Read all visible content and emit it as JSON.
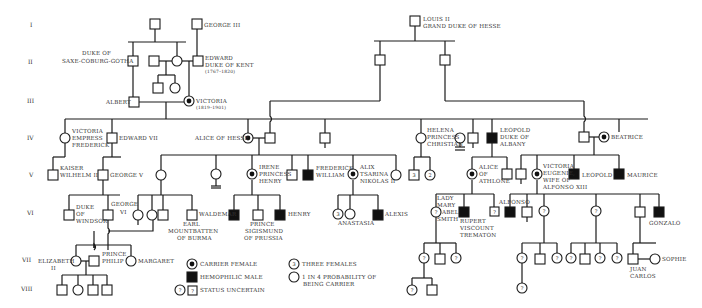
{
  "generations": [
    "I",
    "II",
    "III",
    "IV",
    "V",
    "VI",
    "VII",
    "VIII"
  ],
  "people": {
    "george_iii": "GEORGE III",
    "louis_ii_1": "LOUIS II",
    "louis_ii_2": "GRAND DUKE OF HESSE",
    "duke_saxe_1": "DUKE OF",
    "duke_saxe_2": "SAXE-COBURG-GOTHA",
    "edward_kent_1": "EDWARD",
    "edward_kent_2": "DUKE OF KENT",
    "edward_kent_3": "(1767–1820)",
    "albert": "ALBERT",
    "victoria_1": "VICTORIA",
    "victoria_2": "(1819–1901)",
    "victoria_empress_1": "VICTORIA",
    "victoria_empress_2": "EMPRESS",
    "victoria_empress_3": "FREDERICK",
    "edward_vii": "EDWARD VII",
    "alice_hesse": "ALICE OF HESSE",
    "helena_1": "HELENA",
    "helena_2": "PRINCESS",
    "helena_3": "CHRISTIAN",
    "leopold_albany_1": "LEOPOLD",
    "leopold_albany_2": "DUKE OF",
    "leopold_albany_3": "ALBANY",
    "beatrice": "BEATRICE",
    "kaiser_1": "KAISER",
    "kaiser_2": "WILHELM II",
    "george_v": "GEORGE V",
    "irene_1": "IRENE",
    "irene_2": "PRINCESS",
    "irene_3": "HENRY",
    "frederick_william_1": "FREDERICK",
    "frederick_william_2": "WILLIAM",
    "alix_1": "ALIX",
    "alix_2": "TSARINA",
    "alix_3": "NIKOLAS II",
    "alice_athlone_1": "ALICE",
    "alice_athlone_2": "OF",
    "alice_athlone_3": "ATHLONE",
    "victoria_eugenie_1": "VICTORIA",
    "victoria_eugenie_2": "EUGENIE,",
    "victoria_eugenie_3": "WIFE OF",
    "victoria_eugenie_4": "ALFONSO XIII",
    "leopold": "LEOPOLD",
    "maurice": "MAURICE",
    "duke_windsor_1": "DUKE",
    "duke_windsor_2": "OF",
    "duke_windsor_3": "WINDSOR",
    "george_vi_1": "GEORGE",
    "george_vi_2": "VI",
    "waldemar": "WALDEMAR",
    "mountbatten_1": "EARL",
    "mountbatten_2": "MOUNTBATTEN",
    "mountbatten_3": "OF BURMA",
    "sigismund_1": "PRINCE",
    "sigismund_2": "SIGISMUND",
    "sigismund_3": "OF PRUSSIA",
    "henry": "HENRY",
    "anastasia": "ANASTASIA",
    "alexis": "ALEXIS",
    "lady_mary_1": "LADY",
    "lady_mary_2": "MARY",
    "lady_mary_3": "ABEL",
    "lady_mary_4": "SMITH",
    "rupert_1": "RUPERT",
    "rupert_2": "VISCOUNT",
    "rupert_3": "TREMATON",
    "alfonso": "ALFONSO",
    "gonzalo": "GONZALO",
    "elizabeth_1": "ELIZABETH",
    "elizabeth_2": "II",
    "philip_1": "PRINCE",
    "philip_2": "PHILIP",
    "margaret": "MARGARET",
    "juan_carlos_1": "JUAN",
    "juan_carlos_2": "CARLOS",
    "sophie": "SOPHIE"
  },
  "counts": {
    "helena_sons": "3",
    "helena_daughters": "2",
    "alix_daughters": "3",
    "uncertain": "?"
  },
  "legend": {
    "carrier_female": "CARRIER FEMALE",
    "hemophilic_male": "HEMOPHILIC MALE",
    "status_uncertain": "STATUS UNCERTAIN",
    "three_females_num": "3",
    "three_females": "THREE FEMALES",
    "probability_1": "1 IN 4 PROBABILITY OF",
    "probability_2": "BEING CARRIER"
  }
}
